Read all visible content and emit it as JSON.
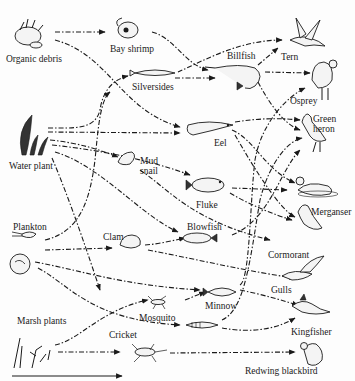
{
  "diagram": {
    "type": "food-web",
    "legend_arrow": "direction of energy flow",
    "nodes": [
      {
        "id": "organic_debris",
        "label": "Organic debris",
        "x": 30,
        "y": 38,
        "lx": 6,
        "ly": 54
      },
      {
        "id": "bay_shrimp",
        "label": "Bay shrimp",
        "x": 130,
        "y": 30,
        "lx": 110,
        "ly": 44
      },
      {
        "id": "silversides",
        "label": "Silversides",
        "x": 160,
        "y": 73,
        "lx": 132,
        "ly": 82
      },
      {
        "id": "billfish",
        "label": "Billfish",
        "x": 243,
        "y": 70,
        "lx": 227,
        "ly": 51
      },
      {
        "id": "tern",
        "label": "Tern",
        "x": 302,
        "y": 45,
        "lx": 281,
        "ly": 52
      },
      {
        "id": "osprey",
        "label": "Osprey",
        "x": 321,
        "y": 80,
        "lx": 290,
        "ly": 96
      },
      {
        "id": "green_heron",
        "label": "Green\nheron",
        "x": 320,
        "y": 135,
        "lx": 313,
        "ly": 114
      },
      {
        "id": "water_plant",
        "label": "Water plant",
        "x": 30,
        "y": 140,
        "lx": 9,
        "ly": 161
      },
      {
        "id": "eel",
        "label": "Eel",
        "x": 205,
        "y": 127,
        "lx": 214,
        "ly": 138
      },
      {
        "id": "mud_snail",
        "label": "Mud\nsnail",
        "x": 127,
        "y": 162,
        "lx": 140,
        "ly": 156
      },
      {
        "id": "fluke",
        "label": "Fluke",
        "x": 208,
        "y": 185,
        "lx": 196,
        "ly": 200
      },
      {
        "id": "merganser",
        "label": "Merganser",
        "x": 326,
        "y": 187,
        "lx": 311,
        "ly": 207
      },
      {
        "id": "plankton",
        "label": "Plankton",
        "x": 24,
        "y": 235,
        "lx": 13,
        "ly": 222
      },
      {
        "id": "clam",
        "label": "Clam",
        "x": 129,
        "y": 240,
        "lx": 103,
        "ly": 232
      },
      {
        "id": "blowfish",
        "label": "Blowfish",
        "x": 205,
        "y": 238,
        "lx": 187,
        "ly": 222
      },
      {
        "id": "cormorant",
        "label": "Cormorant",
        "x": 314,
        "y": 225,
        "lx": 268,
        "ly": 250
      },
      {
        "id": "periphyton",
        "label": "",
        "x": 18,
        "y": 262,
        "lx": 0,
        "ly": 0
      },
      {
        "id": "gulls",
        "label": "Gulls",
        "x": 325,
        "y": 272,
        "lx": 271,
        "ly": 285
      },
      {
        "id": "minnow",
        "label": "Minnow",
        "x": 222,
        "y": 292,
        "lx": 205,
        "ly": 301
      },
      {
        "id": "mosquito",
        "label": "Mosquito",
        "x": 165,
        "y": 302,
        "lx": 139,
        "ly": 313
      },
      {
        "id": "kingfisher",
        "label": "Kingfisher",
        "x": 320,
        "y": 307,
        "lx": 291,
        "ly": 327
      },
      {
        "id": "small_fish",
        "label": "",
        "x": 204,
        "y": 325,
        "lx": 0,
        "ly": 0
      },
      {
        "id": "marsh_plants",
        "label": "Marsh plants",
        "x": 35,
        "y": 350,
        "lx": 17,
        "ly": 316
      },
      {
        "id": "cricket",
        "label": "Cricket",
        "x": 145,
        "y": 352,
        "lx": 109,
        "ly": 330
      },
      {
        "id": "redwing_blackbird",
        "label": "Redwing blackbird",
        "x": 315,
        "y": 355,
        "lx": 245,
        "ly": 366
      }
    ],
    "edges": [
      {
        "from": "organic_debris",
        "to": "bay_shrimp",
        "d": "M55 32 L105 32"
      },
      {
        "from": "organic_debris",
        "to": "eel",
        "d": "M55 40 C110 55 120 110 180 127"
      },
      {
        "from": "bay_shrimp",
        "to": "billfish",
        "d": "M152 32 C175 38 185 65 208 70"
      },
      {
        "from": "silversides",
        "to": "tern",
        "d": "M178 72 C205 60 240 40 282 40"
      },
      {
        "from": "silversides",
        "to": "osprey",
        "d": "M175 78 L215 78"
      },
      {
        "from": "billfish",
        "to": "tern",
        "d": "M258 65 L278 48"
      },
      {
        "from": "billfish",
        "to": "osprey",
        "d": "M265 72 L310 73"
      },
      {
        "from": "billfish",
        "to": "green_heron",
        "d": "M258 82 C270 105 285 125 300 130"
      },
      {
        "from": "water_plant",
        "to": "silversides",
        "d": "M48 128 C75 128 95 130 100 110 C102 95 110 80 128 76"
      },
      {
        "from": "water_plant",
        "to": "eel",
        "d": "M48 132 L180 133"
      },
      {
        "from": "water_plant",
        "to": "mud_snail",
        "d": "M50 140 C80 143 100 150 118 157"
      },
      {
        "from": "water_plant",
        "to": "fluke",
        "d": "M52 145 C100 150 150 160 190 175"
      },
      {
        "from": "water_plant",
        "to": "blowfish",
        "d": "M55 152 C100 165 140 215 178 232"
      },
      {
        "from": "water_plant",
        "to": "minnow",
        "d": "M52 158 C70 200 90 260 100 290"
      },
      {
        "from": "mud_snail",
        "to": "merganser",
        "d": "M140 170 C170 190 190 220 270 240"
      },
      {
        "from": "eel",
        "to": "merganser",
        "d": "M232 130 C255 140 265 170 295 183"
      },
      {
        "from": "eel",
        "to": "cormorant",
        "d": "M235 135 C255 170 280 210 295 217"
      },
      {
        "from": "eel",
        "to": "green_heron",
        "d": "M235 122 C260 118 280 118 300 120"
      },
      {
        "from": "fluke",
        "to": "merganser",
        "d": "M232 188 L287 190"
      },
      {
        "from": "fluke",
        "to": "cormorant",
        "d": "M230 193 C250 205 275 215 292 220"
      },
      {
        "from": "blowfish",
        "to": "green_heron",
        "d": "M232 235 C270 220 280 170 300 150"
      },
      {
        "from": "plankton",
        "to": "silversides",
        "d": "M45 240 C80 232 90 200 95 160 C98 130 100 100 110 92"
      },
      {
        "from": "plankton",
        "to": "clam",
        "d": "M45 250 L112 248"
      },
      {
        "from": "clam",
        "to": "blowfish",
        "d": "M145 245 C160 244 175 240 185 238"
      },
      {
        "from": "clam",
        "to": "gulls",
        "d": "M148 250 C200 260 250 272 295 278"
      },
      {
        "from": "periphyton",
        "to": "minnow",
        "d": "M35 262 C80 270 120 285 200 290"
      },
      {
        "from": "periphyton",
        "to": "small_fish",
        "d": "M38 268 C70 285 90 320 180 325"
      },
      {
        "from": "minnow",
        "to": "kingfisher",
        "d": "M240 290 C265 295 280 300 298 305"
      },
      {
        "from": "minnow",
        "to": "osprey",
        "d": "M240 285 C250 280 250 200 255 160 C262 120 290 95 305 88"
      },
      {
        "from": "small_fish",
        "to": "kingfisher",
        "d": "M222 328 C250 333 275 330 295 318"
      },
      {
        "from": "small_fish",
        "to": "green_heron",
        "d": "M222 320 C245 310 250 260 260 200 C270 160 290 140 302 138"
      },
      {
        "from": "marsh_plants",
        "to": "mosquito",
        "d": "M55 345 C80 340 100 310 148 300"
      },
      {
        "from": "marsh_plants",
        "to": "cricket",
        "d": "M58 352 L120 352"
      },
      {
        "from": "cricket",
        "to": "redwing_blackbird",
        "d": "M170 353 L295 352"
      },
      {
        "from": "mosquito",
        "to": "minnow",
        "d": "M185 300 L205 292"
      }
    ]
  }
}
